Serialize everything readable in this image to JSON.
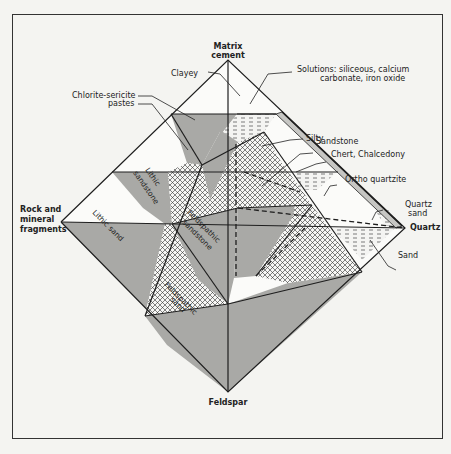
{
  "figure": {
    "type": "sandstone classification tetrahedron",
    "vertices": {
      "top": "Matrix cement",
      "top_line1": "Matrix",
      "top_line2": "cement",
      "left": "Rock and mineral fragments",
      "left_line1": "Rock and",
      "left_line2": "mineral",
      "left_line3": "fragments",
      "right": "Quartz",
      "bottom": "Feldspar"
    },
    "callouts": {
      "clayey": "Clayey",
      "solutions_line1": "Solutions:  siliceous, calcium",
      "solutions_line2": "carbonate, iron oxide",
      "chlorite_line1": "Chlorite-sericite",
      "chlorite_line2": "pastes",
      "silty": "Silty",
      "sandstone": "Sandstone",
      "chert": "Chert, Chalcedony",
      "ortho_quartzite": "Ortho quartzite",
      "quartz_sand_line1": "Quartz",
      "quartz_sand_line2": "sand",
      "sand": "Sand"
    },
    "inner_labels": {
      "lithic_sandstone_line1": "Lithic",
      "lithic_sandstone_line2": "sandstone",
      "lithic_sand": "Lithic sand",
      "feldspathic_sandstone_line1": "Feldspathic",
      "feldspathic_sandstone_line2": "sandstone",
      "feldspathic_sand_line1": "Feldspathic",
      "feldspathic_sand_line2": "sand"
    }
  },
  "colors": {
    "gray_fill": "#a9a9a6",
    "line": "#1e1e1e",
    "background": "#f4f4f1",
    "white_face": "#fbfbf9"
  }
}
